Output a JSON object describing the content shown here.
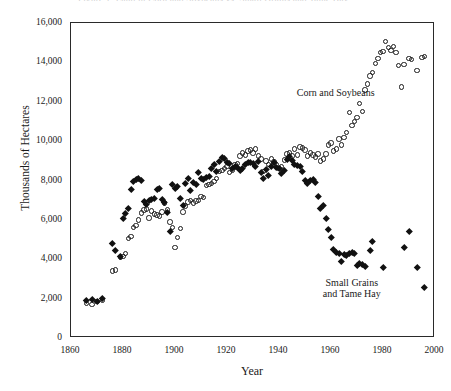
{
  "figure": {
    "clipped_caption": "Figure 1.  Land in Corn and Soybeans vs. Small Grains and Tame Hay"
  },
  "chart_data": {
    "type": "scatter",
    "title": "",
    "xlabel": "Year",
    "ylabel": "Thousands of Hectares",
    "xlim": [
      1860,
      2000
    ],
    "ylim": [
      0,
      16000
    ],
    "xticks": [
      "1860",
      "1880",
      "1900",
      "1920",
      "1940",
      "1960",
      "1980",
      "2000"
    ],
    "xtick_values": [
      1860,
      1880,
      1900,
      1920,
      1940,
      1960,
      1980,
      2000
    ],
    "yticks": [
      "0",
      "2,000",
      "4,000",
      "6,000",
      "8,000",
      "10,000",
      "12,000",
      "14,000",
      "16,000"
    ],
    "ytick_values": [
      0,
      2000,
      4000,
      6000,
      8000,
      10000,
      12000,
      14000,
      16000
    ],
    "grid": false,
    "legend_position": "inline-annotation",
    "annotations": [
      {
        "id": "corn-soybeans",
        "text": "Corn and Soybeans",
        "x": 1968,
        "y": 12450
      },
      {
        "id": "small-grains",
        "text": "Small Grains and Tame Hay",
        "x": 1968,
        "y": 2700
      }
    ],
    "series": [
      {
        "name": "Corn and Soybeans",
        "marker": "open-circle",
        "color": "#1a1a1a",
        "points": [
          [
            1866,
            1750
          ],
          [
            1868,
            1700
          ],
          [
            1870,
            1850
          ],
          [
            1872,
            1900
          ],
          [
            1876,
            3400
          ],
          [
            1877,
            3450
          ],
          [
            1879,
            4100
          ],
          [
            1880,
            4150
          ],
          [
            1881,
            4300
          ],
          [
            1882,
            5050
          ],
          [
            1883,
            5150
          ],
          [
            1884,
            5600
          ],
          [
            1885,
            5700
          ],
          [
            1886,
            6000
          ],
          [
            1887,
            6350
          ],
          [
            1888,
            6500
          ],
          [
            1889,
            6550
          ],
          [
            1890,
            6100
          ],
          [
            1891,
            6450
          ],
          [
            1892,
            6300
          ],
          [
            1893,
            6250
          ],
          [
            1894,
            6200
          ],
          [
            1895,
            6400
          ],
          [
            1896,
            6850
          ],
          [
            1897,
            6500
          ],
          [
            1898,
            5900
          ],
          [
            1899,
            5600
          ],
          [
            1900,
            4600
          ],
          [
            1901,
            5100
          ],
          [
            1902,
            5550
          ],
          [
            1903,
            6400
          ],
          [
            1904,
            6700
          ],
          [
            1905,
            6900
          ],
          [
            1906,
            7000
          ],
          [
            1907,
            6850
          ],
          [
            1908,
            6950
          ],
          [
            1909,
            7000
          ],
          [
            1910,
            7200
          ],
          [
            1911,
            7150
          ],
          [
            1912,
            7750
          ],
          [
            1913,
            7800
          ],
          [
            1914,
            7850
          ],
          [
            1915,
            7950
          ],
          [
            1916,
            8100
          ],
          [
            1917,
            8450
          ],
          [
            1918,
            8500
          ],
          [
            1919,
            8600
          ],
          [
            1920,
            8700
          ],
          [
            1921,
            8400
          ],
          [
            1922,
            8500
          ],
          [
            1923,
            8800
          ],
          [
            1924,
            8850
          ],
          [
            1925,
            9250
          ],
          [
            1926,
            9400
          ],
          [
            1927,
            9300
          ],
          [
            1928,
            9500
          ],
          [
            1929,
            9550
          ],
          [
            1930,
            9400
          ],
          [
            1931,
            9600
          ],
          [
            1932,
            9250
          ],
          [
            1933,
            9100
          ],
          [
            1934,
            8450
          ],
          [
            1935,
            9000
          ],
          [
            1936,
            8800
          ],
          [
            1937,
            9100
          ],
          [
            1938,
            8950
          ],
          [
            1939,
            8800
          ],
          [
            1940,
            8600
          ],
          [
            1941,
            8700
          ],
          [
            1942,
            9050
          ],
          [
            1943,
            9350
          ],
          [
            1944,
            9400
          ],
          [
            1945,
            9250
          ],
          [
            1946,
            9600
          ],
          [
            1947,
            9300
          ],
          [
            1948,
            9700
          ],
          [
            1949,
            9650
          ],
          [
            1950,
            9550
          ],
          [
            1951,
            9250
          ],
          [
            1952,
            9400
          ],
          [
            1953,
            9300
          ],
          [
            1954,
            9200
          ],
          [
            1955,
            9350
          ],
          [
            1956,
            9000
          ],
          [
            1957,
            9100
          ],
          [
            1958,
            9350
          ],
          [
            1959,
            9800
          ],
          [
            1960,
            9900
          ],
          [
            1961,
            9500
          ],
          [
            1962,
            9600
          ],
          [
            1963,
            10100
          ],
          [
            1964,
            9800
          ],
          [
            1965,
            10200
          ],
          [
            1966,
            10450
          ],
          [
            1967,
            11450
          ],
          [
            1968,
            10800
          ],
          [
            1969,
            11000
          ],
          [
            1970,
            11200
          ],
          [
            1971,
            11900
          ],
          [
            1972,
            11500
          ],
          [
            1973,
            12600
          ],
          [
            1974,
            12900
          ],
          [
            1975,
            13300
          ],
          [
            1976,
            13500
          ],
          [
            1977,
            13950
          ],
          [
            1978,
            14200
          ],
          [
            1979,
            14500
          ],
          [
            1980,
            14550
          ],
          [
            1981,
            15050
          ],
          [
            1982,
            14750
          ],
          [
            1983,
            14600
          ],
          [
            1984,
            14800
          ],
          [
            1985,
            14500
          ],
          [
            1986,
            13850
          ],
          [
            1987,
            12750
          ],
          [
            1988,
            13900
          ],
          [
            1990,
            14200
          ],
          [
            1991,
            14150
          ],
          [
            1993,
            13600
          ],
          [
            1995,
            14250
          ],
          [
            1996,
            14300
          ]
        ]
      },
      {
        "name": "Small Grains and Tame Hay",
        "marker": "filled-diamond",
        "color": "#111111",
        "points": [
          [
            1866,
            1900
          ],
          [
            1868,
            1950
          ],
          [
            1870,
            1850
          ],
          [
            1872,
            2000
          ],
          [
            1876,
            4800
          ],
          [
            1877,
            4450
          ],
          [
            1879,
            4150
          ],
          [
            1880,
            6100
          ],
          [
            1881,
            6350
          ],
          [
            1882,
            6600
          ],
          [
            1883,
            7550
          ],
          [
            1884,
            7950
          ],
          [
            1885,
            8050
          ],
          [
            1886,
            8100
          ],
          [
            1887,
            8000
          ],
          [
            1888,
            6950
          ],
          [
            1889,
            6800
          ],
          [
            1890,
            7000
          ],
          [
            1891,
            7050
          ],
          [
            1892,
            7100
          ],
          [
            1893,
            7550
          ],
          [
            1894,
            7600
          ],
          [
            1895,
            7050
          ],
          [
            1896,
            6900
          ],
          [
            1897,
            6400
          ],
          [
            1898,
            5400
          ],
          [
            1899,
            7800
          ],
          [
            1900,
            7600
          ],
          [
            1901,
            7700
          ],
          [
            1902,
            7100
          ],
          [
            1903,
            6750
          ],
          [
            1904,
            7850
          ],
          [
            1905,
            8100
          ],
          [
            1906,
            7500
          ],
          [
            1907,
            7900
          ],
          [
            1908,
            7800
          ],
          [
            1909,
            8400
          ],
          [
            1910,
            8100
          ],
          [
            1911,
            8050
          ],
          [
            1912,
            8150
          ],
          [
            1913,
            8200
          ],
          [
            1914,
            8600
          ],
          [
            1915,
            8800
          ],
          [
            1916,
            8450
          ],
          [
            1917,
            9000
          ],
          [
            1918,
            9200
          ],
          [
            1919,
            9150
          ],
          [
            1920,
            8900
          ],
          [
            1921,
            8850
          ],
          [
            1922,
            8600
          ],
          [
            1923,
            8700
          ],
          [
            1924,
            8650
          ],
          [
            1925,
            8500
          ],
          [
            1926,
            8600
          ],
          [
            1927,
            8800
          ],
          [
            1928,
            8950
          ],
          [
            1929,
            8900
          ],
          [
            1930,
            8850
          ],
          [
            1931,
            8700
          ],
          [
            1932,
            9000
          ],
          [
            1933,
            8400
          ],
          [
            1934,
            8100
          ],
          [
            1935,
            8550
          ],
          [
            1936,
            8250
          ],
          [
            1937,
            8700
          ],
          [
            1938,
            8900
          ],
          [
            1939,
            8650
          ],
          [
            1940,
            8600
          ],
          [
            1941,
            8350
          ],
          [
            1942,
            8500
          ],
          [
            1943,
            9100
          ],
          [
            1944,
            9250
          ],
          [
            1945,
            9050
          ],
          [
            1946,
            8800
          ],
          [
            1947,
            8750
          ],
          [
            1948,
            8700
          ],
          [
            1949,
            8450
          ],
          [
            1950,
            8000
          ],
          [
            1951,
            7850
          ],
          [
            1952,
            8000
          ],
          [
            1953,
            8050
          ],
          [
            1954,
            7900
          ],
          [
            1955,
            7200
          ],
          [
            1956,
            6600
          ],
          [
            1957,
            6750
          ],
          [
            1958,
            6100
          ],
          [
            1959,
            5500
          ],
          [
            1960,
            5100
          ],
          [
            1961,
            4500
          ],
          [
            1962,
            4350
          ],
          [
            1963,
            4300
          ],
          [
            1964,
            3900
          ],
          [
            1965,
            4250
          ],
          [
            1966,
            4200
          ],
          [
            1967,
            4300
          ],
          [
            1968,
            4350
          ],
          [
            1969,
            4300
          ],
          [
            1970,
            3700
          ],
          [
            1971,
            3800
          ],
          [
            1972,
            3750
          ],
          [
            1973,
            3650
          ],
          [
            1975,
            4450
          ],
          [
            1976,
            4900
          ],
          [
            1980,
            3600
          ],
          [
            1988,
            4600
          ],
          [
            1990,
            5400
          ],
          [
            1993,
            3600
          ],
          [
            1996,
            2600
          ]
        ]
      }
    ]
  }
}
